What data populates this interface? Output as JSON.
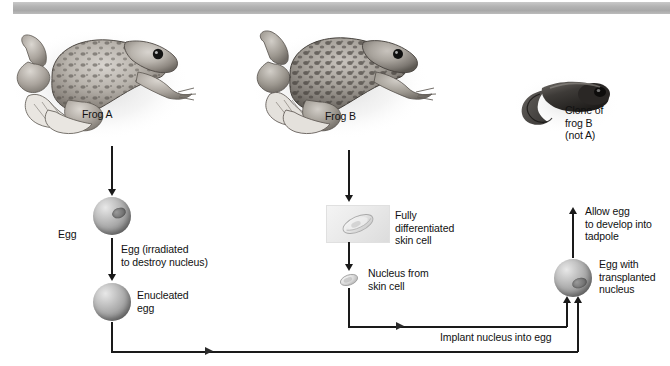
{
  "figure": {
    "domain": "diagram",
    "topic": "Nuclear transplantation cloning in frogs",
    "banner_color": "#b4b4b4",
    "background": "#ffffff",
    "line_color": "#1a1a1a",
    "text_color": "#111111"
  },
  "organisms": [
    {
      "id": "frog-a",
      "label": "Frog A",
      "role": "egg donor"
    },
    {
      "id": "frog-b",
      "label": "Frog B",
      "role": "nucleus donor"
    },
    {
      "id": "tadpole",
      "label": "Clone of\nfrog B\n(not A)",
      "role": "resulting clone"
    }
  ],
  "steps": {
    "egg": "Egg",
    "irradiated": "Egg (irradiated\nto destroy nucleus)",
    "enucleated": "Enucleated\negg",
    "skin_cell": "Fully\ndifferentiated\nskin cell",
    "nucleus_from_skin": "Nucleus from\nskin cell",
    "implant": "Implant nucleus into egg",
    "transplanted": "Egg with\ntransplanted\nnucleus",
    "develop": "Allow egg\nto develop into\ntadpole"
  }
}
